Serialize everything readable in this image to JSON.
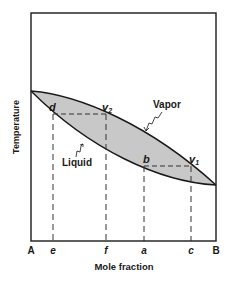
{
  "diagram": {
    "type": "binary phase diagram (temperature vs mole fraction)",
    "y_axis_label": "Temperature",
    "x_axis_label": "Mole fraction",
    "x_endpoints": {
      "left": "A",
      "right": "B"
    },
    "x_markers": [
      "e",
      "f",
      "a",
      "c"
    ],
    "region_labels": {
      "vapor": "Vapor",
      "liquid": "Liquid"
    },
    "points": {
      "d": "d",
      "v2": "v",
      "v2_sub": "2",
      "b": "b",
      "v1": "v",
      "v1_sub": "1"
    },
    "colors": {
      "frame": "#1a1a1a",
      "two_phase_fill": "#c8c8c8",
      "dashed": "#333333"
    }
  }
}
